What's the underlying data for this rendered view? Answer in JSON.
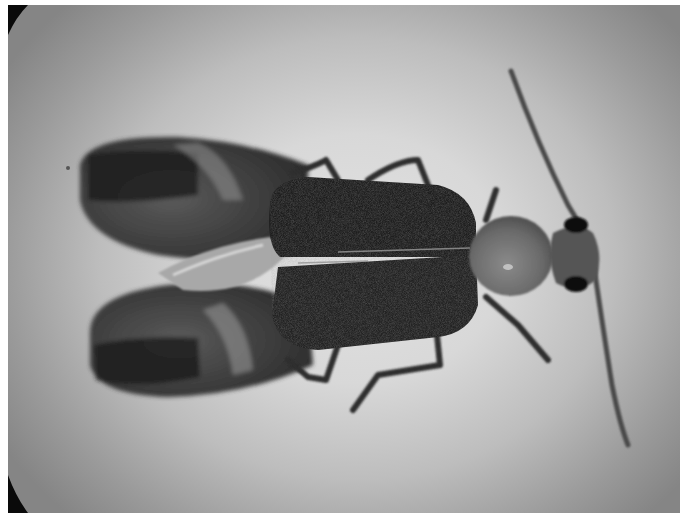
{
  "image": {
    "type": "photograph",
    "mode": "grayscale",
    "subject": "beetle, dorsal view, wings spread",
    "alt": "Grayscale microscope photo of a soft-winged beetle viewed from above with hind wings spread, two long antennae and six legs",
    "colors": {
      "background_center": "#e2e2e2",
      "background_edge": "#858585",
      "vignette": "#0a0a0a",
      "elytra": "#1e1e1e",
      "hindwing": "#3c3c3c",
      "wing_band": "#1a1a1a",
      "pronotum": "#6e6e6e",
      "head": "#555555",
      "eyes": "#0e0e0e",
      "legs": "#2e2e2e",
      "antennae": "#4a4a4a"
    }
  }
}
